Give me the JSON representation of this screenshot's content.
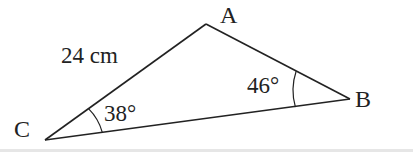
{
  "diagram": {
    "type": "triangle",
    "colors": {
      "stroke": "#222222",
      "text": "#222222",
      "background": "#ffffff"
    },
    "vertices": [
      {
        "id": "A",
        "label": "A",
        "x": 206,
        "y": 24
      },
      {
        "id": "B",
        "label": "B",
        "x": 350,
        "y": 99
      },
      {
        "id": "C",
        "label": "C",
        "x": 45,
        "y": 140
      }
    ],
    "sides": [
      {
        "from": "C",
        "to": "A",
        "label": "24 cm"
      }
    ],
    "angles": [
      {
        "vertex": "C",
        "label": "38°"
      },
      {
        "vertex": "B",
        "label": "46°"
      }
    ]
  }
}
